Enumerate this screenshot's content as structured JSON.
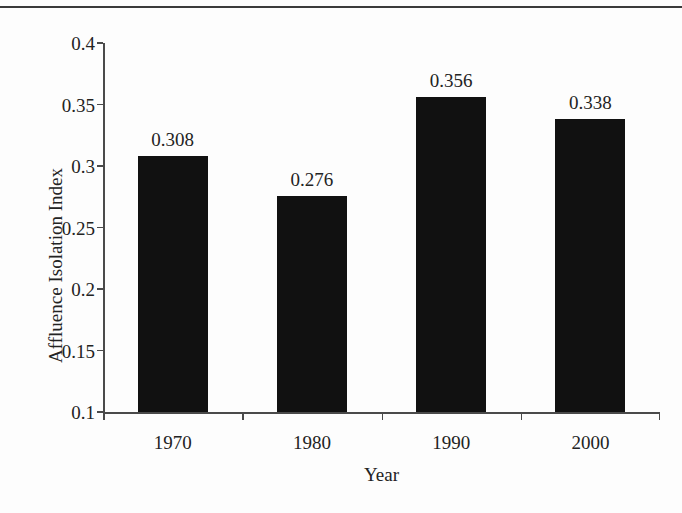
{
  "figure": {
    "background_color": "#fdfdfd",
    "rule_color": "#3a3a3a",
    "bar_color": "#111111",
    "axis_color": "#4a4a4a",
    "text_color": "#232323"
  },
  "chart_data": {
    "type": "bar",
    "title": "",
    "xlabel": "Year",
    "ylabel": "Affluence Isolation Index",
    "categories": [
      "1970",
      "1980",
      "1990",
      "2000"
    ],
    "values": [
      0.308,
      0.276,
      0.356,
      0.338
    ],
    "value_labels": [
      "0.308",
      "0.276",
      "0.356",
      "0.338"
    ],
    "ylim": [
      0.1,
      0.4
    ],
    "yticks": [
      0.1,
      0.15,
      0.2,
      0.25,
      0.3,
      0.35,
      0.4
    ],
    "ytick_labels": [
      "0.1",
      "0.15",
      "0.2",
      "0.25",
      "0.3",
      "0.35",
      "0.4"
    ],
    "grid": false,
    "legend": null,
    "legend_position": "none",
    "bar_color": "#111111",
    "orientation": "vertical"
  }
}
